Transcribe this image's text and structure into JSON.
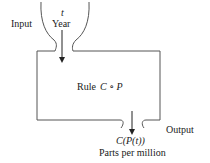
{
  "diagram": {
    "input": {
      "side_label": "Input",
      "variable": "t",
      "description": "Year"
    },
    "rule": {
      "prefix": "Rule",
      "expression": "C ∘ P"
    },
    "output": {
      "side_label": "Output",
      "expression": "C(P(t))",
      "description": "Parts per million"
    },
    "colors": {
      "stroke": "#555555",
      "text": "#1a1a1a",
      "background": "#ffffff"
    }
  }
}
